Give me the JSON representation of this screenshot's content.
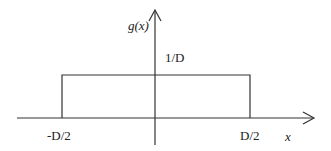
{
  "diagram": {
    "function_label": "g(x)",
    "height_label": "1/D",
    "left_edge_label": "-D/2",
    "right_edge_label": "D/2",
    "x_axis_label": "x",
    "line_color": "#333333"
  }
}
